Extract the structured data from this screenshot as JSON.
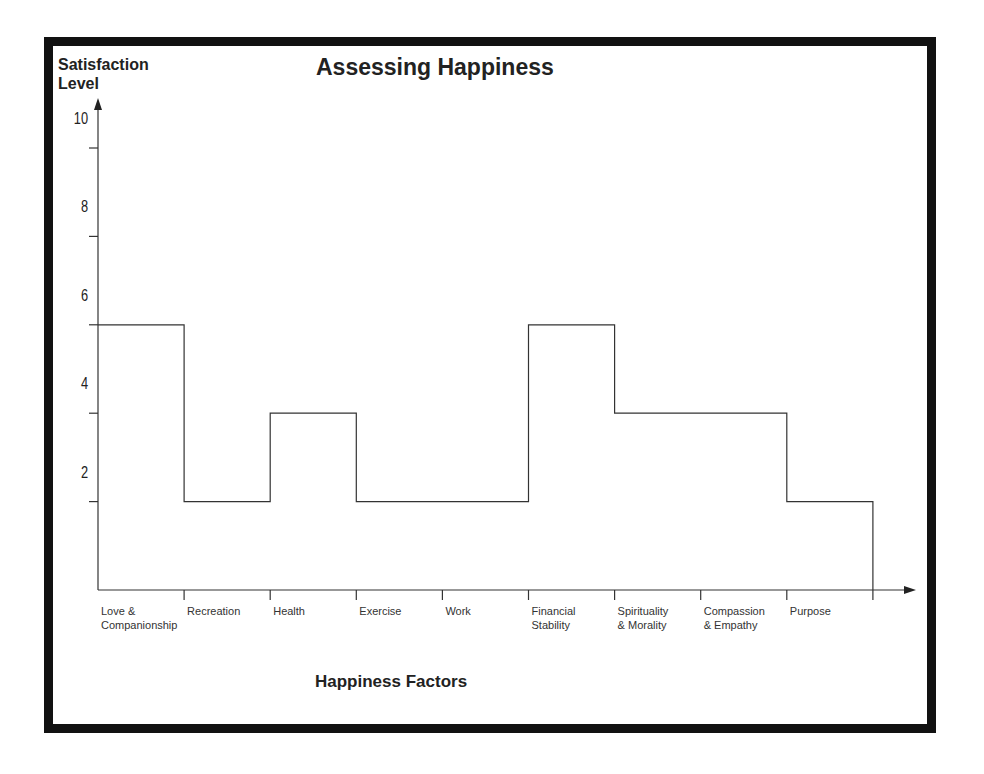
{
  "chart_data": {
    "type": "line",
    "subtype": "step",
    "title": "Assessing Happiness",
    "xlabel": "Happiness Factors",
    "ylabel": "Satisfaction Level",
    "categories": [
      "Love & Companionship",
      "Recreation",
      "Health",
      "Exercise",
      "Work",
      "Financial Stability",
      "Spirituality & Morality",
      "Compassion & Empathy",
      "Purpose"
    ],
    "values": [
      6,
      2,
      4,
      2,
      2,
      6,
      4,
      4,
      2
    ],
    "yticks": [
      2,
      4,
      6,
      8,
      10
    ],
    "ylim": [
      0,
      10
    ],
    "grid": false,
    "legend": null
  },
  "labels": {
    "title": "Assessing Happiness",
    "ylabel_line1": "Satisfaction",
    "ylabel_line2": "Level",
    "xlabel": "Happiness Factors",
    "yticks": [
      "10",
      "8",
      "6",
      "4",
      "2"
    ],
    "categories": [
      [
        "Love &",
        "Companionship"
      ],
      [
        "Recreation",
        ""
      ],
      [
        "Health",
        ""
      ],
      [
        "Exercise",
        ""
      ],
      [
        "Work",
        ""
      ],
      [
        "Financial",
        "Stability"
      ],
      [
        "Spirituality",
        "& Morality"
      ],
      [
        "Compassion",
        "& Empathy"
      ],
      [
        "Purpose",
        ""
      ]
    ]
  }
}
